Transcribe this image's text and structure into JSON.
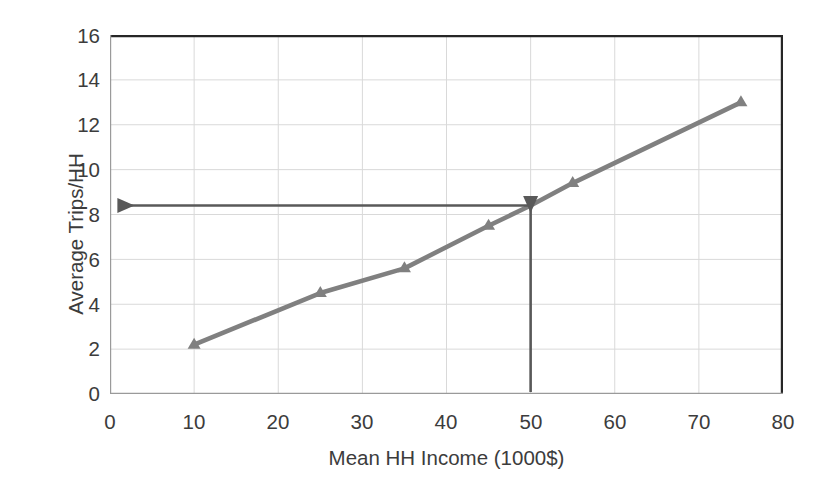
{
  "chart_data": {
    "type": "line",
    "title": "",
    "xlabel": "Mean HH Income (1000$)",
    "ylabel": "Average Trips/HH",
    "xlim": [
      0,
      80
    ],
    "ylim": [
      0,
      16
    ],
    "xticks": [
      0,
      10,
      20,
      30,
      40,
      50,
      60,
      70,
      80
    ],
    "yticks": [
      0,
      2,
      4,
      6,
      8,
      10,
      12,
      14,
      16
    ],
    "xtick_labels": [
      "0",
      "10",
      "20",
      "30",
      "40",
      "50",
      "60",
      "70",
      "80"
    ],
    "ytick_labels": [
      "0",
      "2",
      "4",
      "6",
      "8",
      "10",
      "12",
      "14",
      "16"
    ],
    "grid": true,
    "grid_axis": "both",
    "legend": false,
    "legend_position": "none",
    "series": [
      {
        "name": "Average Trips per Household",
        "marker": "triangle",
        "color": "#808080",
        "line_color": "#808080",
        "x": [
          10,
          25,
          35,
          45,
          50,
          55,
          75
        ],
        "y": [
          2.2,
          4.5,
          5.6,
          7.5,
          8.4,
          9.4,
          13.0
        ]
      }
    ],
    "annotations": [
      {
        "name": "income-lookup-vertical-arrow",
        "type": "arrow",
        "from": [
          50,
          0
        ],
        "to": [
          50,
          8.4
        ],
        "color": "#595959",
        "label": "50"
      },
      {
        "name": "trips-readout-horizontal-arrow",
        "type": "arrow",
        "from": [
          50,
          8.4
        ],
        "to": [
          0,
          8.4
        ],
        "color": "#595959",
        "label": "8.4"
      }
    ],
    "colors": {
      "series_line": "#808080",
      "annotation_arrow": "#595959",
      "gridline": "#d9d9d9",
      "axis_line": "#262626",
      "text": "#3c3c3c",
      "background": "#ffffff"
    }
  }
}
